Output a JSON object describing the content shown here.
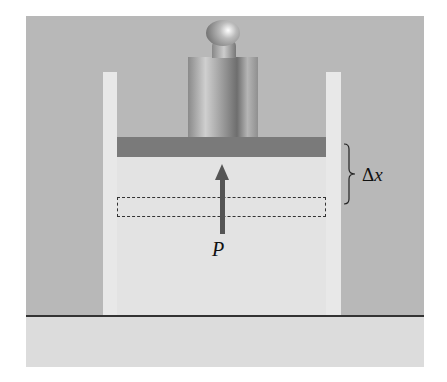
{
  "diagram": {
    "labels": {
      "pressure": "P",
      "displacement_symbol": "Δ",
      "displacement_var": "x"
    },
    "components": [
      "weight",
      "piston",
      "cylinder walls",
      "gas",
      "dashed initial piston position",
      "pressure arrow",
      "Δx brace",
      "floor"
    ],
    "colors": {
      "background": "#b8b8b8",
      "floor": "#dcdcdc",
      "gas": "#e3e3e3",
      "piston": "#7a7a7a",
      "arrow": "#555555"
    }
  }
}
